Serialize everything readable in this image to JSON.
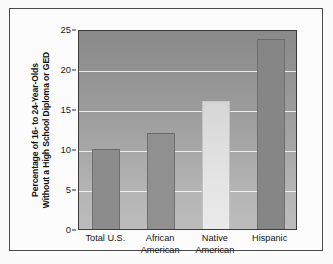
{
  "chart_data": {
    "type": "bar",
    "title": "",
    "subtitle": "",
    "xlabel": "",
    "ylabel": "Percentage of 16- to 24-Year-Olds Without a High School Diploma or GED",
    "ylabel_lines": [
      "Percentage of 16- to 24-Year-Olds",
      "Without a High School Diploma or GED"
    ],
    "categories": [
      "Total U.S.",
      "African American",
      "Native American",
      "Hispanic"
    ],
    "category_lines": [
      [
        "Total U.S."
      ],
      [
        "African",
        "American"
      ],
      [
        "Native",
        "American"
      ],
      [
        "Hispanic"
      ]
    ],
    "values": [
      10.0,
      12.0,
      16.0,
      23.7
    ],
    "ylim": [
      0,
      25
    ],
    "yticks": [
      0,
      5,
      10,
      15,
      20,
      25
    ],
    "ytick_labels": [
      "0",
      "5",
      "10",
      "15",
      "20",
      "25"
    ],
    "grid": true,
    "grid_axis": "y",
    "legend": "none",
    "bar_colors": [
      "#8c8c8c",
      "#909090",
      "#dcdcdc",
      "#868686"
    ],
    "plot_bg_top": "#898989",
    "plot_bg_bottom": "#bdbdbd",
    "gridline_color": "#f2f2f2",
    "frame_color": "#4a4a4a",
    "axis_color": "#3c3c3c"
  }
}
